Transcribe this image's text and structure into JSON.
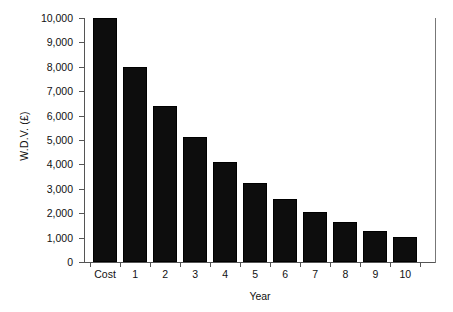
{
  "chart_data": {
    "type": "bar",
    "title": "",
    "subtitle": "",
    "xlabel": "Year",
    "ylabel": "W.D.V. (£)",
    "categories": [
      "Cost",
      "1",
      "2",
      "3",
      "4",
      "5",
      "6",
      "7",
      "8",
      "9",
      "10"
    ],
    "values": [
      10000,
      8000,
      6400,
      5120,
      4100,
      3250,
      2600,
      2050,
      1620,
      1280,
      1020
    ],
    "ylim": [
      0,
      10000
    ],
    "y_ticks": [
      0,
      1000,
      2000,
      3000,
      4000,
      5000,
      6000,
      7000,
      8000,
      9000,
      10000
    ],
    "y_tick_labels": [
      "0",
      "1,000",
      "2,000",
      "3,000",
      "4,000",
      "5,000",
      "6,000",
      "7,000",
      "8,000",
      "9,000",
      "10,000"
    ],
    "grid": false,
    "legend": null,
    "legend_position": "none",
    "bar_color": "#0d0d0d",
    "axis_color": "#555555",
    "background_color": "#ffffff"
  }
}
